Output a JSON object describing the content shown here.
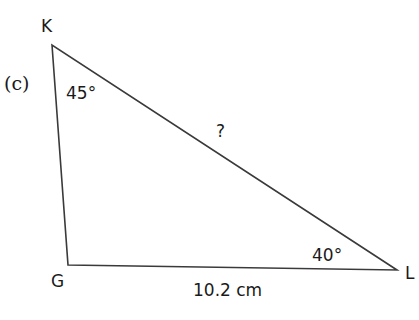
{
  "part_label": "(c)",
  "vertices": {
    "K": "K",
    "G": "G",
    "L": "L"
  },
  "angles": {
    "K": "45°",
    "L": "40°"
  },
  "sides": {
    "KL": "?",
    "GL": "10.2 cm"
  },
  "colors": {
    "line": "#3a3a3a",
    "text": "#1a1a1a"
  }
}
